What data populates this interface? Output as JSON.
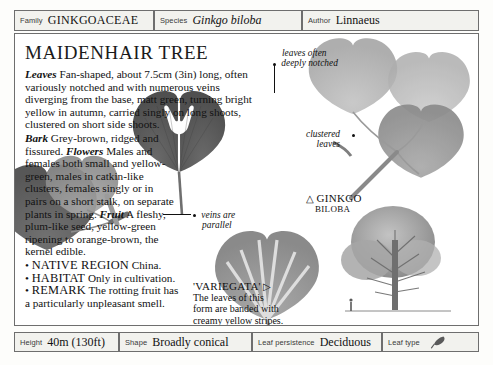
{
  "header": {
    "family": {
      "label": "Family",
      "value": "GINKGOACEAE"
    },
    "species": {
      "label": "Species",
      "value": "Ginkgo biloba"
    },
    "author": {
      "label": "Author",
      "value": "Linnaeus"
    }
  },
  "title": "MAIDENHAIR TREE",
  "description": {
    "leaves_key": "Leaves",
    "leaves_text": " Fan-shaped, about 7.5cm (3in) long, often variously notched and with numerous veins diverging from the base, matt green, turning bright yellow in autumn, carried singly on long shoots, clustered on short side shoots. ",
    "bark_key": "Bark",
    "bark_text": " Grey-brown, ridged and fissured. ",
    "flowers_key": "Flowers",
    "flowers_text": " Males and females both small and yellow-green, males in catkin-like clusters, females singly or in pairs on a short stalk, on separate plants in spring. ",
    "fruit_key": "Fruit",
    "fruit_text": " A fleshy, plum-like seed, yellow-green ripening to orange-brown, the kernel edible."
  },
  "bullets": [
    {
      "bullet": "•",
      "head": "NATIVE REGION",
      "text": " China."
    },
    {
      "bullet": "•",
      "head": "HABITAT",
      "text": " Only in cultivation."
    },
    {
      "bullet": "•",
      "head": "REMARK",
      "text": " The rotting fruit has a particularly unpleasant smell."
    }
  ],
  "annotations": {
    "notched": {
      "line1": "leaves often",
      "line2": "deeply notched"
    },
    "clustered": {
      "line1": "clustered",
      "line2": "leaves"
    },
    "veins": {
      "line1": "veins are",
      "line2": "parallel"
    }
  },
  "captions": {
    "species_plate": {
      "marker": "△",
      "line1": "GINKGO",
      "line2": "BILOBA"
    },
    "variegata": {
      "title": "'VARIEGATA'",
      "marker": "▷",
      "line1": "The leaves of this",
      "line2": "form are banded with",
      "line3": "creamy yellow stripes."
    }
  },
  "footer": {
    "height": {
      "label": "Height",
      "value": "40m (130ft)"
    },
    "shape": {
      "label": "Shape",
      "value": "Broadly conical"
    },
    "persistence": {
      "label": "Leaf persistence",
      "value": "Deciduous"
    },
    "leaf_type": {
      "label": "Leaf type",
      "icon": "leaf-glyph-icon"
    }
  },
  "colors": {
    "border": "#6e6e6e",
    "field_fill": "#f2f2ee",
    "leaf_dark": "#5d5d5d",
    "leaf_mid": "#8e8e8e",
    "leaf_light": "#b9b9b9",
    "text": "#111111"
  }
}
